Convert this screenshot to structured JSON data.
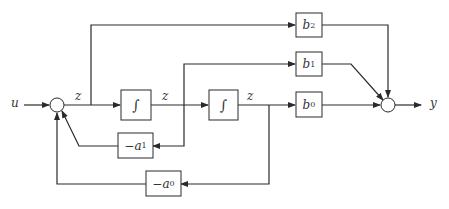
{
  "diagram": {
    "type": "block diagram (controllable canonical form, 2nd order)",
    "signals": {
      "input": "u",
      "output": "y",
      "z_labels": [
        "z",
        "z",
        "z"
      ]
    },
    "blocks": {
      "integrator_1": {
        "symbol": "∫"
      },
      "integrator_2": {
        "symbol": "∫"
      },
      "b2": {
        "name": "b",
        "sub": "2"
      },
      "b1": {
        "name": "b",
        "sub": "1"
      },
      "b0": {
        "name": "b",
        "sub": "0"
      },
      "neg_a1": {
        "prefix": "−",
        "name": "a",
        "sub": "1"
      },
      "neg_a0": {
        "prefix": "−",
        "name": "a",
        "sub": "0"
      }
    },
    "summing_junctions": [
      "input-sum",
      "output-sum"
    ],
    "colors": {
      "line": "#2a2a2a",
      "background": "#ffffff"
    }
  }
}
